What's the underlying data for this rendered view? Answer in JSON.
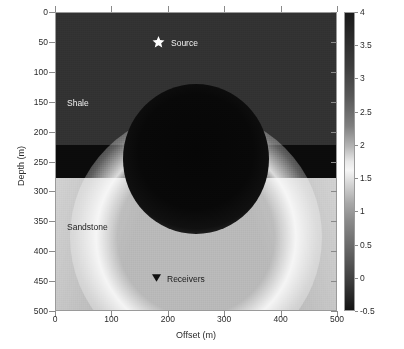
{
  "figure": {
    "xlabel": "Offset (m)",
    "ylabel": "Depth (m)",
    "source_label": "Source",
    "receivers_label": "Receivers",
    "shale_label": "Shale",
    "sandstone_label": "Sandstone",
    "colorbar_title": "Electrical potential distribution",
    "source_icon": "star-marker",
    "receivers_icon": "triangle-down-marker"
  },
  "chart_data": {
    "type": "heatmap",
    "title": "",
    "xlabel": "Offset (m)",
    "ylabel": "Depth (m)",
    "xlim": [
      0,
      500
    ],
    "ylim": [
      500,
      0
    ],
    "y_axis_inverted": true,
    "xticks": [
      0,
      100,
      200,
      300,
      400,
      500
    ],
    "yticks": [
      0,
      50,
      100,
      150,
      200,
      250,
      300,
      350,
      400,
      450,
      500
    ],
    "grid": false,
    "colormap": "grayscale",
    "colorbar": {
      "label": "Electrical potential distribution",
      "ticks": [
        4,
        3.5,
        3,
        2.5,
        2,
        1.5,
        1,
        0.5,
        0,
        -0.5
      ],
      "tick_labels": [
        "4",
        "3.5",
        "3",
        "2.5",
        "2",
        "1.5",
        "1",
        "0.5",
        "0",
        "-0.5"
      ],
      "vmin": -0.5,
      "vmax": 4,
      "position": "right",
      "orientation": "vertical"
    },
    "layers": [
      {
        "name": "Shale",
        "depth_range_m": [
          0,
          235
        ],
        "appearance": "dark grey, speckled noise",
        "approx_value": 0.2
      },
      {
        "name": "Interface band",
        "depth_range_m": [
          235,
          270
        ],
        "appearance": "near-black thin horizontal band",
        "approx_value": -0.4
      },
      {
        "name": "Sandstone",
        "depth_range_m": [
          270,
          500
        ],
        "appearance": "light grey",
        "approx_value": 2.2
      }
    ],
    "features": [
      {
        "name": "conductive anomaly",
        "shape": "circle",
        "center_offset_m": 250,
        "center_depth_m": 185,
        "radius_m": 130,
        "approx_value": -0.5
      },
      {
        "name": "bright potential halo",
        "shape": "arc",
        "center_offset_m": 250,
        "center_depth_m": 280,
        "radius_m": 215,
        "approx_value": 3.6
      },
      {
        "name": "upper corner rays",
        "shape": "fan",
        "approx_value": 2.8
      }
    ],
    "annotations": [
      {
        "text": "Source",
        "offset_m": 250,
        "depth_m": 50,
        "marker": "star",
        "color": "#ffffff"
      },
      {
        "text": "Receivers",
        "offset_m": 250,
        "depth_m": 450,
        "marker": "triangle_down",
        "color": "#1a1a1a"
      },
      {
        "text": "Shale",
        "offset_m": 30,
        "depth_m": 150,
        "marker": "none",
        "color": "#f0f0f0"
      },
      {
        "text": "Sandstone",
        "offset_m": 30,
        "depth_m": 355,
        "marker": "none",
        "color": "#1c1c1c"
      }
    ]
  },
  "axes": {
    "x_tick_labels": [
      "0",
      "100",
      "200",
      "300",
      "400",
      "500"
    ],
    "y_tick_labels": [
      "0",
      "50",
      "100",
      "150",
      "200",
      "250",
      "300",
      "350",
      "400",
      "450",
      "500"
    ]
  }
}
